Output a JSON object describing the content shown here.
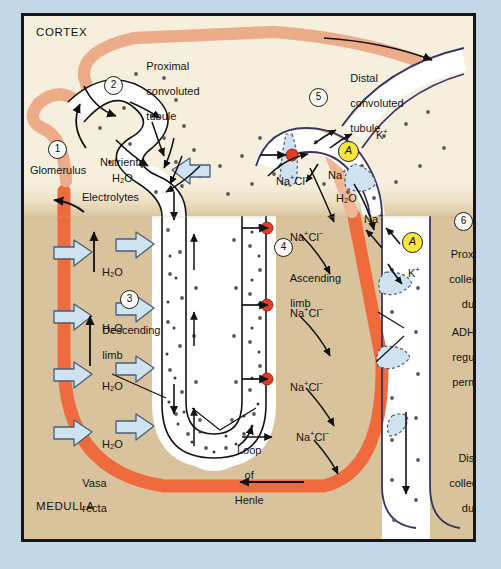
{
  "figure": {
    "regions": {
      "cortex_label": "CORTEX",
      "medulla_label": "MEDULLA"
    }
  },
  "colors": {
    "outer_background": "#c3d7e6",
    "frame_border": "#14161c",
    "cortex_fill": "#f7efdd",
    "medulla_fill": "#d9c39c",
    "vessel_light": "#f0b696",
    "vessel_dark": "#ef6b3e",
    "tubule_outline_dark": "#3b3564",
    "tubule_outline_black": "#17140f",
    "water_arrow_fill": "#cfe2ef",
    "water_arrow_stroke": "#4a5e78",
    "transporter_red": "#e33b1e",
    "pump_yellow": "#fbe53f",
    "dot_gray": "#5a5a5a",
    "tubule_fill_white": "#ffffff"
  },
  "steps": [
    {
      "n": "1",
      "label": "Glomerulus"
    },
    {
      "n": "2",
      "label": "Proximal\nconvoluted\ntubule"
    },
    {
      "n": "3",
      "label": "Descending\nlimb"
    },
    {
      "n": "4",
      "label": "Ascending\nlimb"
    },
    {
      "n": "5",
      "label": "Distal\nconvoluted\ntubule"
    },
    {
      "n": "6",
      "label": "Proximal\ncollecting\nduct"
    }
  ],
  "labels": {
    "cortex": "CORTEX",
    "medulla": "MEDULLA",
    "glomerulus": "Glomerulus",
    "proximal_convoluted_tubule_l1": "Proximal",
    "proximal_convoluted_tubule_l2": "convoluted",
    "proximal_convoluted_tubule_l3": "tubule",
    "nutrients": "Nutrients",
    "electrolytes": "Electrolytes",
    "descending_l1": "Descending",
    "descending_l2": "limb",
    "ascending_l1": "Ascending",
    "ascending_l2": "limb",
    "distal_convoluted_tubule_l1": "Distal",
    "distal_convoluted_tubule_l2": "convoluted",
    "distal_convoluted_tubule_l3": "tubule",
    "proximal_collecting_duct_l1": "Proximal",
    "proximal_collecting_duct_l2": "collecting",
    "proximal_collecting_duct_l3": "duct",
    "distal_collecting_duct_l1": "Distal",
    "distal_collecting_duct_l2": "collecting",
    "distal_collecting_duct_l3": "duct",
    "loop_of_henle_l1": "Loop",
    "loop_of_henle_l2": "of",
    "loop_of_henle_l3": "Henle",
    "vasa_recta_l1": "Vasa",
    "vasa_recta_l2": "recta",
    "adh_l1": "ADH",
    "adh_l2": "regulated",
    "adh_l3": "permeability",
    "pump_aldosterone": "A"
  },
  "molecules": {
    "water": {
      "base": "H",
      "sub": "2",
      "tail": "O"
    },
    "sodium_chloride": {
      "na": "Na",
      "na_charge": "+",
      "cl": "Cl",
      "cl_charge": "−"
    },
    "sodium": {
      "na": "Na",
      "charge": "+"
    },
    "potassium": {
      "k": "K",
      "charge": "+"
    }
  },
  "water_arrow_labels": [
    {
      "id": "pct-h2o",
      "text": "H2O"
    },
    {
      "id": "descending-h2o-1",
      "text": "H2O"
    },
    {
      "id": "descending-h2o-2",
      "text": "H2O"
    },
    {
      "id": "descending-h2o-3",
      "text": "H2O"
    },
    {
      "id": "descending-h2o-4",
      "text": "H2O"
    },
    {
      "id": "dct-h2o",
      "text": "H2O"
    }
  ],
  "nacl_labels": [
    {
      "id": "nacl-dct-top",
      "y": 163
    },
    {
      "id": "nacl-asc-1",
      "y": 222
    },
    {
      "id": "nacl-asc-2",
      "y": 298
    },
    {
      "id": "nacl-asc-3",
      "y": 372
    },
    {
      "id": "nacl-asc-4",
      "y": 421
    }
  ],
  "ion_labels": [
    {
      "id": "k-plus-top",
      "text": "K+"
    },
    {
      "id": "na-plus-dct",
      "text": "Na+"
    },
    {
      "id": "na-plus-pcd",
      "text": "Na+"
    },
    {
      "id": "k-plus-pcd",
      "text": "K+"
    }
  ]
}
